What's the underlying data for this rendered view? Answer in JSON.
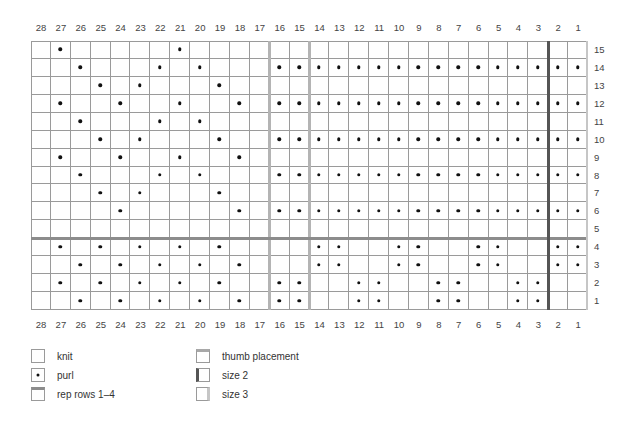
{
  "chart_data": {
    "type": "table",
    "columns": [
      28,
      27,
      26,
      25,
      24,
      23,
      22,
      21,
      20,
      19,
      18,
      17,
      16,
      15,
      14,
      13,
      12,
      11,
      10,
      9,
      8,
      7,
      6,
      5,
      4,
      3,
      2,
      1
    ],
    "rows": [
      15,
      14,
      13,
      12,
      11,
      10,
      9,
      8,
      7,
      6,
      5,
      4,
      3,
      2,
      1
    ],
    "symbol_default": "knit",
    "purl_stitches": {
      "15": [
        27,
        21
      ],
      "14": [
        26,
        22,
        20,
        16,
        15,
        14,
        13,
        12,
        11,
        10,
        9,
        8,
        7,
        6,
        5,
        4,
        3,
        2,
        1
      ],
      "13": [
        25,
        23,
        19
      ],
      "12": [
        27,
        24,
        21,
        18,
        16,
        15,
        14,
        13,
        12,
        11,
        10,
        9,
        8,
        7,
        6,
        5,
        4,
        3,
        2,
        1
      ],
      "11": [
        26,
        22,
        20
      ],
      "10": [
        25,
        23,
        19,
        16,
        15,
        14,
        13,
        12,
        11,
        10,
        9,
        8,
        7,
        6,
        5,
        4,
        3,
        2,
        1
      ],
      "9": [
        27,
        24,
        21,
        18
      ],
      "8": [
        26,
        22,
        20,
        16,
        15,
        14,
        13,
        12,
        11,
        10,
        9,
        8,
        7,
        6,
        5,
        4,
        3,
        2,
        1
      ],
      "7": [
        25,
        23,
        19
      ],
      "6": [
        24,
        18,
        16,
        15,
        14,
        13,
        12,
        11,
        10,
        9,
        8,
        7,
        6,
        5,
        4,
        3,
        2,
        1
      ],
      "5": [],
      "4": [
        27,
        25,
        23,
        21,
        19,
        14,
        13,
        10,
        9,
        6,
        5,
        2,
        1
      ],
      "3": [
        26,
        24,
        22,
        20,
        18,
        14,
        13,
        10,
        9,
        6,
        5,
        2,
        1
      ],
      "2": [
        27,
        25,
        23,
        21,
        19,
        16,
        15,
        12,
        11,
        8,
        7,
        4,
        3
      ],
      "1": [
        26,
        24,
        22,
        20,
        18,
        16,
        15,
        12,
        11,
        8,
        7,
        4,
        3
      ]
    },
    "markers": {
      "rep_rows_line": {
        "between_rows": [
          5,
          4
        ],
        "color": "#8c8c8c"
      },
      "thumb_placement_lines": [
        {
          "between_cols": [
            17,
            16
          ]
        },
        {
          "between_cols": [
            15,
            14
          ]
        }
      ],
      "thumb_color": "#b4b4b4",
      "size_2_line": {
        "between_cols": [
          3,
          2
        ],
        "color": "#555555"
      },
      "size_3_line": {
        "right_edge_after_col": 1,
        "color": "#c6c6c6"
      }
    },
    "legend": [
      {
        "key": "knit",
        "label": "knit"
      },
      {
        "key": "purl",
        "label": "purl"
      },
      {
        "key": "rep",
        "label": "rep rows 1–4"
      },
      {
        "key": "thumb",
        "label": "thumb placement"
      },
      {
        "key": "size2",
        "label": "size 2"
      },
      {
        "key": "size3",
        "label": "size 3"
      }
    ]
  },
  "legend": {
    "knit": "knit",
    "purl": "purl",
    "rep": "rep rows 1–4",
    "thumb": "thumb placement",
    "size2": "size 2",
    "size3": "size 3"
  }
}
